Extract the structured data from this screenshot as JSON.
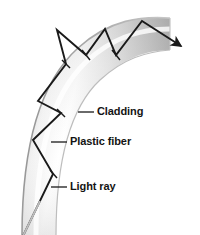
{
  "figure": {
    "type": "diagram",
    "canvas": {
      "width": 200,
      "height": 235,
      "background": "#ffffff"
    },
    "colors": {
      "ray": "#1a1a1a",
      "text": "#141414",
      "leader": "#1a1a1a",
      "tube_light": "#ffffff",
      "tube_mid": "#d8d8d8",
      "tube_dark": "#9a9a9a",
      "tube_edge": "#8c8c8c"
    },
    "labels": [
      {
        "id": "cladding",
        "text": "Cladding",
        "x": 97,
        "y": 106,
        "leader": {
          "x1": 78,
          "y1": 112,
          "x2": 94,
          "y2": 112
        }
      },
      {
        "id": "plastic_fiber",
        "text": "Plastic fiber",
        "x": 70,
        "y": 136,
        "leader": {
          "x1": 51,
          "y1": 142,
          "x2": 67,
          "y2": 142
        }
      },
      {
        "id": "light_ray",
        "text": "Light ray",
        "x": 70,
        "y": 181,
        "leader": {
          "x1": 51,
          "y1": 187,
          "x2": 67,
          "y2": 187
        }
      }
    ],
    "fiber": {
      "shape": "quarter-arc bent tube",
      "outer_edge": "M 22 235 C 22 150 38 84 78 48 C 110 19 142 16 168 18",
      "inner_edge": "M 56 235 C 56 160 70 108 100 80 C 124 58 146 52 166 50",
      "wall_thickness_px": 33
    },
    "light_ray": {
      "description": "zigzag ray undergoing total internal reflection, entering bottom-left and exiting top-right",
      "points": [
        [
          23,
          235
        ],
        [
          53,
          174
        ],
        [
          33,
          140
        ],
        [
          61,
          113
        ],
        [
          38,
          101
        ],
        [
          66,
          64
        ],
        [
          57,
          30
        ],
        [
          86,
          55
        ],
        [
          105,
          29
        ],
        [
          116,
          55
        ],
        [
          142,
          21
        ],
        [
          181,
          46
        ]
      ],
      "arrow_at_end": true,
      "reflection_ticks": [
        {
          "x": 53,
          "y": 174,
          "angle": 118
        },
        {
          "x": 61,
          "y": 113,
          "angle": 100
        },
        {
          "x": 66,
          "y": 64,
          "angle": 72
        },
        {
          "x": 86,
          "y": 55,
          "angle": 48
        },
        {
          "x": 116,
          "y": 55,
          "angle": 34
        }
      ]
    }
  }
}
